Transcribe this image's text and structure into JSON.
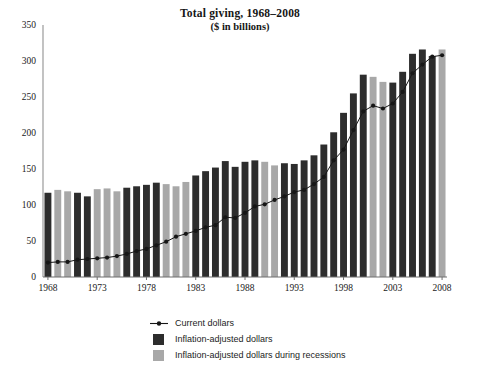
{
  "chart_data": {
    "type": "bar",
    "title": "Total giving, 1968–2008",
    "subtitle": "($ in billions)",
    "xlabel": "",
    "ylabel": "",
    "ylim": [
      0,
      350
    ],
    "ytick_step": 50,
    "yticks": [
      0,
      50,
      100,
      150,
      200,
      250,
      300,
      350
    ],
    "grid": false,
    "legend_position": "bottom-center",
    "x": [
      1968,
      1969,
      1970,
      1971,
      1972,
      1973,
      1974,
      1975,
      1976,
      1977,
      1978,
      1979,
      1980,
      1981,
      1982,
      1983,
      1984,
      1985,
      1986,
      1987,
      1988,
      1989,
      1990,
      1991,
      1992,
      1993,
      1994,
      1995,
      1996,
      1997,
      1998,
      1999,
      2000,
      2001,
      2002,
      2003,
      2004,
      2005,
      2006,
      2007,
      2008
    ],
    "xticks": [
      1968,
      1973,
      1978,
      1983,
      1988,
      1993,
      1998,
      2003,
      2008
    ],
    "xtick_labels": [
      "1968",
      "1973",
      "1978",
      "1983",
      "1988",
      "1993",
      "1998",
      "2003",
      "2008"
    ],
    "recession_years": [
      1969,
      1970,
      1973,
      1974,
      1975,
      1980,
      1981,
      1982,
      1990,
      1991,
      2001,
      2002,
      2008
    ],
    "series": [
      {
        "name": "Inflation-adjusted dollars",
        "type": "bar",
        "color": "#2d2d2d",
        "values": [
          117,
          121,
          119,
          117,
          112,
          122,
          123,
          119,
          124,
          126,
          128,
          131,
          129,
          126,
          132,
          141,
          147,
          152,
          161,
          153,
          160,
          162,
          160,
          155,
          158,
          157,
          162,
          169,
          184,
          201,
          228,
          255,
          281,
          278,
          271,
          270,
          285,
          310,
          316,
          307,
          316
        ]
      },
      {
        "name": "Current dollars",
        "type": "line",
        "color": "#161616",
        "marker": "circle",
        "values": [
          20,
          21,
          21,
          24,
          25,
          26,
          27,
          29,
          32,
          36,
          39,
          44,
          49,
          56,
          60,
          64,
          69,
          72,
          83,
          82,
          89,
          98,
          101,
          107,
          112,
          118,
          121,
          129,
          139,
          162,
          177,
          204,
          230,
          238,
          234,
          241,
          257,
          283,
          295,
          306,
          308
        ]
      }
    ],
    "bar_colors": {
      "normal": "#2d2d2d",
      "recession": "#a8a8a8"
    },
    "legend": [
      {
        "label": "Current dollars",
        "marker": "line-dot",
        "color": "#161616"
      },
      {
        "label": "Inflation-adjusted dollars",
        "marker": "square",
        "color": "#2d2d2d"
      },
      {
        "label": "Inflation-adjusted dollars during recessions",
        "marker": "square",
        "color": "#a8a8a8"
      }
    ]
  },
  "axis": {
    "y_axis_color": "#9a9a9a",
    "x_axis_color": "#6f6f6f"
  }
}
